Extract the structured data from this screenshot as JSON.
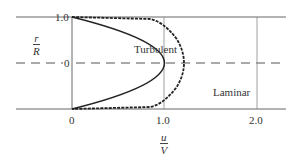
{
  "diagram": {
    "y_axis": {
      "numerator": "r",
      "denominator": "R",
      "ticks": [
        "1.0",
        "0"
      ]
    },
    "x_axis": {
      "numerator": "u",
      "denominator": "V",
      "ticks": [
        "0",
        "1.0",
        "2.0"
      ]
    },
    "curves": [
      {
        "name": "Turbulent",
        "label": "Turbulent",
        "peak_u_over_V": 1.2
      },
      {
        "name": "Laminar",
        "label": "Laminar",
        "peak_u_over_V": 2.0
      }
    ],
    "colors": {
      "line": "#333333",
      "grid": "#777777"
    }
  }
}
